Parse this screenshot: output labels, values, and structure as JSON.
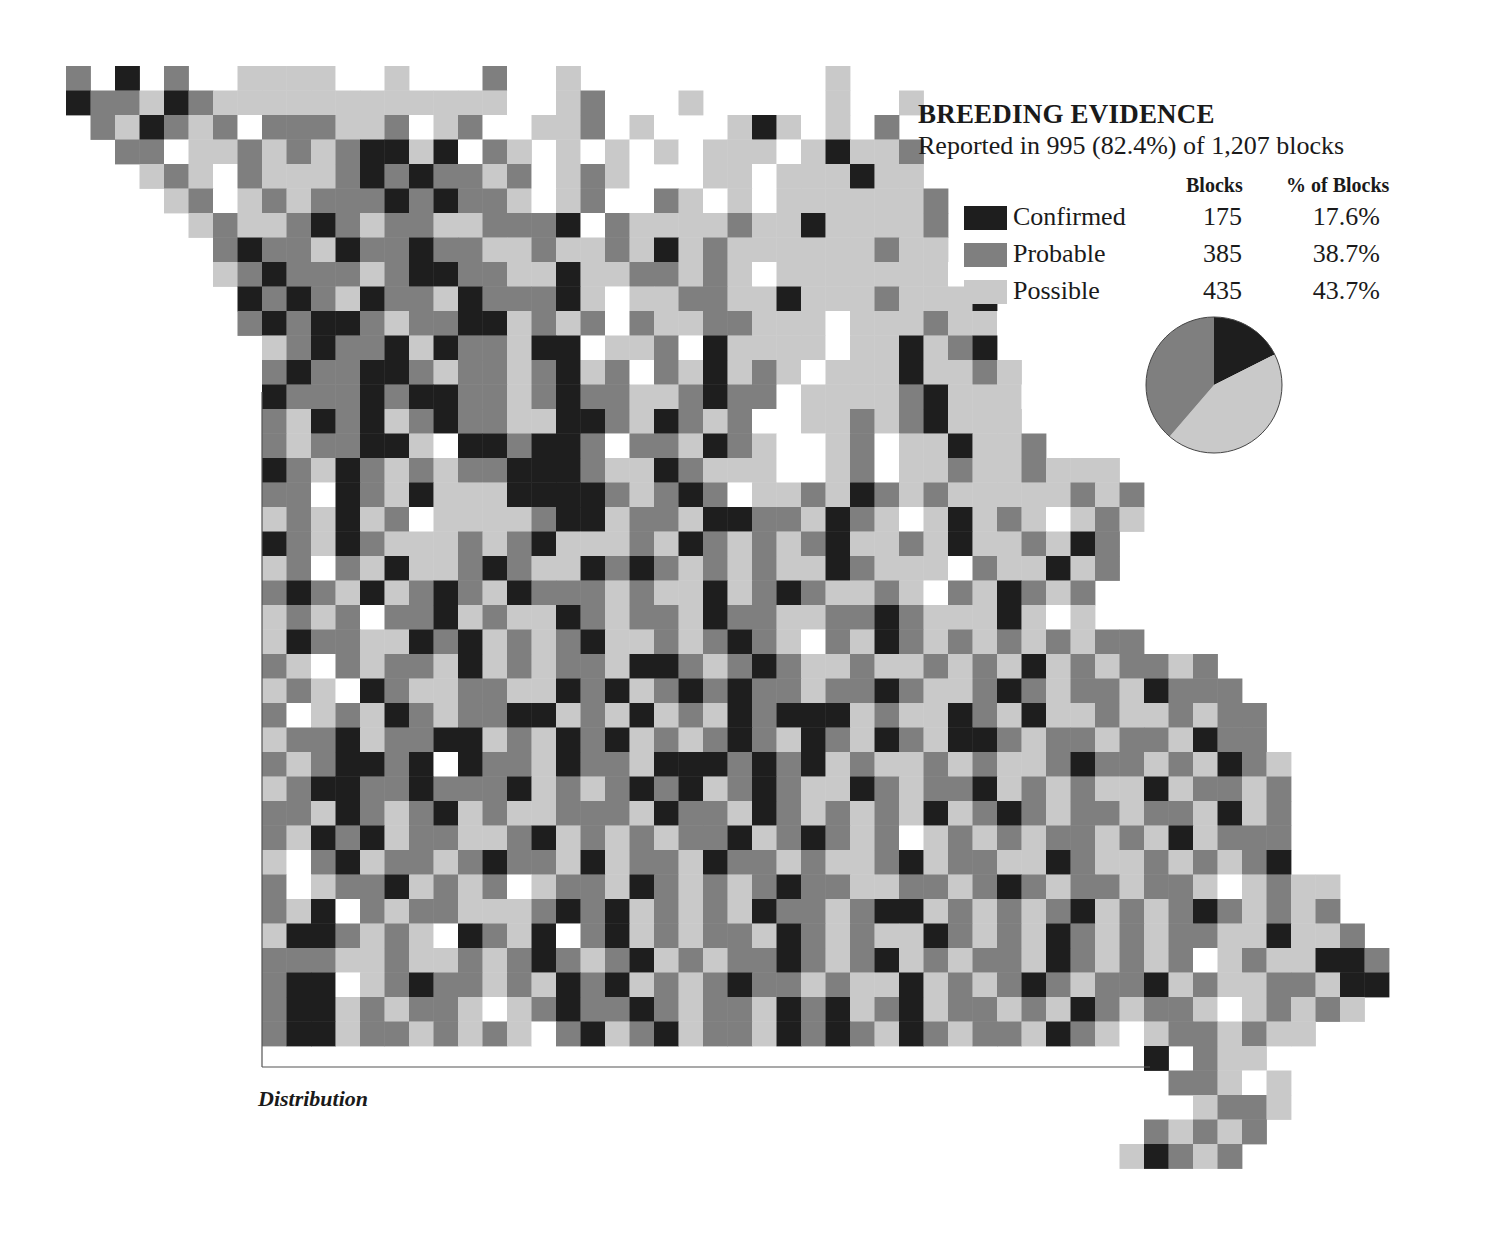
{
  "legend": {
    "title": "BREEDING EVIDENCE",
    "subtitle": "Reported in 995 (82.4%) of 1,207 blocks",
    "col_blocks": "Blocks",
    "col_pct": "% of Blocks",
    "rows": [
      {
        "label": "Confirmed",
        "blocks": "175",
        "pct": "17.6%",
        "color": "#1e1e1e"
      },
      {
        "label": "Probable",
        "blocks": "385",
        "pct": "38.7%",
        "color": "#7f7f7f"
      },
      {
        "label": "Possible",
        "blocks": "435",
        "pct": "43.7%",
        "color": "#c9c9c9"
      }
    ]
  },
  "caption": "Distribution",
  "chart_data": {
    "type": "pie",
    "title": "BREEDING EVIDENCE",
    "subtitle": "Reported in 995 (82.4%) of 1,207 blocks",
    "categories": [
      "Confirmed",
      "Probable",
      "Possible"
    ],
    "values": [
      175,
      385,
      435
    ],
    "percent": [
      17.6,
      38.7,
      43.7
    ],
    "colors": [
      "#1e1e1e",
      "#7f7f7f",
      "#c9c9c9"
    ],
    "total_blocks": 1207,
    "reported_blocks": 995
  },
  "map": {
    "origin": [
      66,
      66
    ],
    "cell": 24.5,
    "key": {
      "C": "#1e1e1e",
      "P": "#7f7f7f",
      "S": "#c9c9c9",
      "W": "#ffffff",
      ".": null
    },
    "rows": [
      "P.C.P..SSSSW.S.W.PW.S..W...W...S...",
      "CPPSCPSSSSSSSSSSSSW.SPW..S...W.S..S",
      ".PSCPSPWPPPSSPWSPW.SSPWSW..SCSWS.P",
      "..PPWSSPSPSPCCSCWPS.SWSWSWSSSWSCSSP",
      "...SPSWPSSSPCPCPPSPWSPSW.WSSWSSSCSS",
      "....SPWSPSPPPCPCPPSWSPWWPSWSWSSSSSSP",
      ".....SPSSPCPSPPSSPPPCWPSSSSPSSCSSSSP",
      "......PCPPSCPPCPPSSPSSPSCSPSSSSSSPSS",
      "......SPCPPPSPCCPPSSCSSPPSPSWSSSSSSSW",
      ".......CPCPSCPPSCPPPCSWSSPPSSCSSSPSSSC",
      ".......PCPCCPSPPCCSPSPWPSSPPSSSWSSSPSSW",
      "........SPCPPCSCPPSCCWSSPWCSSSSWSSCSPC",
      "........PCPPCCPSPPSPCSPWPSCSPSWSSSCSSPS",
      "........CPPPCPCCPPSPCPPSSPCPPWSSSSPCSSSW",
      "........PSCPCSPCPPSSCCPSCPSPWWSSPSPCSSS",
      "........PSPPCCSWCCPCCPWPPSCPSWWSPWSSCSSP",
      "........CPSCPSPSPPCCCPSSCPSSSWWSPWSSPSSPSSS",
      "........PPWCPSCSSSCCCCPSPCPWSSPSCPSPSSSSSPSP",
      "........SPSCSPWSSSSPCCSPPSCCPPSCPSWSCSPSWSPS",
      "........CPSCPSSSPSPCSSSPSCPSPSPCSSPSCSSPSCP",
      "........SPWPSCSSPCPSSCPCPSPSPSSCPSSSWPSSCSP",
      "........PCPSCSPCPSCPPPSPSSCSPCPSSPSWPSCPSP",
      "........SPSPWPPCSPSSCPSPPSCPPSSPPCPSSSCSWS",
      "........SCPPSSCPCSPSPCSSPSPCPSWPSCPSPSPSPSPP",
      "........PSWPSPPSCSPSPPSCCPSPCPSSPSSPSPSCSPSPPSP",
      "........SPSWCPSSPPSSCPCSPCPCPPSPPCPSSPCPSPPSCPPP",
      "........PWSPSCPSPPCCSPSCSPSCPCCCSPSSCPSCSSPSSPSPP",
      "........SPPCSPPCCSPSCPCSPSPCPSCPSCPSCCPSPPSPPSCPP",
      "........PSPCCPCWCPPSCPPSCCCPCPCSPSSPSPSSPCPPSPSCPS",
      "........SPCCPPCPPPCSPSPCPCSPCPSSCPSPPCSPSPSSCSPPSP",
      "........PPSCPSPCSPSSPPPSCPPSCPSPSPSCSPCPSPPSPPSCSP",
      "........PSCPCSPPSSPCSPSPSPPCSPCPSPWSPSPSPPSPSCSPPP",
      "........SWPCSPPSPCPPSCSPPSCPPSPSSPCSPPSSCPSSPSPSPC",
      "........PWSPPCSPSPWSPPSCPSPSPCPPSSPPSPCPSPPSPPSWSPSS",
      "........PSCWPSPPSSSPCPCSPSPSCPPSPCCSPSPSPCSPSPCPSPSP",
      "........SCCPSPSWCPSCWPCSPSPPSCPSPSSCPSPSCPSPSPPSSCSSP",
      "........PPPSSPSSPSPCPSPCSPSPPCPSPCSPSPPSCPSPSPWSPSSCCP",
      "........PCCWSPCPPSPSCPCSPSPCPPSPSSCSPSPCPSPPCSPSSPPSCC",
      "........PCCSPSPPSWSPCPPCPSPPSCPCSPCSPPSPSCPSPPSWSPSPS",
      "........PCCSPPSPSPSWPCSPCSPPSCPCPSCPSPPSCPSWSPPSPSS",
      "............................................C.PSS.",
      ".............................................PPSWS",
      "..............................................SPPS",
      "............................................PSPSP",
      "...........................................SCPSP"
    ]
  }
}
